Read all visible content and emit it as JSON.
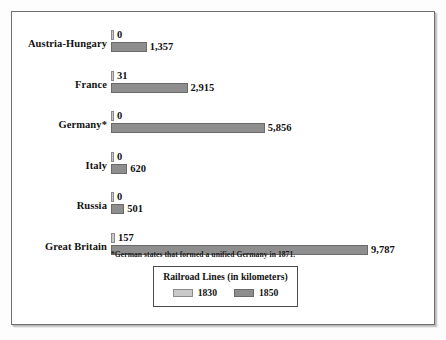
{
  "chart_data": {
    "type": "bar",
    "orientation": "horizontal",
    "title": "Railroad Lines (in kilometers)",
    "xlabel": "",
    "ylabel": "",
    "categories": [
      "Austria-Hungary",
      "France",
      "Germany*",
      "Italy",
      "Russia",
      "Great Britain"
    ],
    "series": [
      {
        "name": "1830",
        "color": "#c9c9c9",
        "values": [
          0,
          31,
          0,
          0,
          0,
          157
        ],
        "labels": [
          "0",
          "31",
          "0",
          "0",
          "0",
          "157"
        ]
      },
      {
        "name": "1850",
        "color": "#8e8e8e",
        "values": [
          1357,
          2915,
          5856,
          620,
          501,
          9787
        ],
        "labels": [
          "1,357",
          "2,915",
          "5,856",
          "620",
          "501",
          "9,787"
        ]
      }
    ],
    "xlim": [
      0,
      9787
    ],
    "grid": false,
    "legend_position": "bottom-center",
    "annotations": [
      "*German states that formed a unified Germany in 1871."
    ]
  },
  "footnote": "*German states that formed a unified Germany in 1871.",
  "legend": {
    "title": "Railroad Lines (in kilometers)",
    "items": [
      {
        "label": "1830",
        "color": "#c9c9c9"
      },
      {
        "label": "1850",
        "color": "#8e8e8e"
      }
    ]
  },
  "colors": {
    "series_1830": "#c9c9c9",
    "series_1850": "#8e8e8e",
    "frame_border": "#6f6f6f",
    "background": "#ffffff",
    "text": "#111111"
  }
}
